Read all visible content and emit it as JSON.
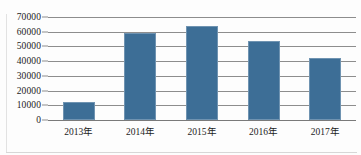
{
  "chart_data": {
    "type": "bar",
    "title": "",
    "subtitle": "",
    "xlabel": "",
    "ylabel": "",
    "categories": [
      "2013年",
      "2014年",
      "2015年",
      "2016年",
      "2017年"
    ],
    "values": [
      12000,
      59000,
      64000,
      54000,
      42000
    ],
    "series": [
      {
        "name": "",
        "values": [
          12000,
          59000,
          64000,
          54000,
          42000
        ]
      }
    ],
    "ylim": [
      0,
      70000
    ],
    "yticks": [
      0,
      10000,
      20000,
      30000,
      40000,
      50000,
      60000,
      70000
    ],
    "ytick_labels": [
      "0",
      "10000",
      "20000",
      "30000",
      "40000",
      "50000",
      "60000",
      "70000"
    ],
    "grid": true,
    "legend": false,
    "legend_position": "none",
    "bar_color": "#3d6e96",
    "bar_edge_color": "#6f93b1",
    "gridline_color": "#8d8d8d",
    "axis_color": "#7a7a7a",
    "text_color": "#1c1c1c",
    "background_color": "#fdfdfd"
  }
}
